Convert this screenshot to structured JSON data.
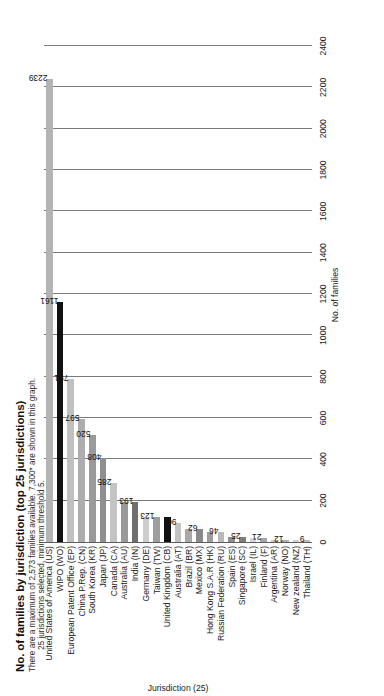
{
  "chart_data": {
    "type": "bar",
    "orientation": "horizontal",
    "title": "No. of families by jurisdiction (top 25 jurisdictions)",
    "subtitle_line1": "There are a maximum of 2,573 families available. 7,300* are shown in this graph.",
    "subtitle_line2": "25 jurisdictions selected, minimum threshold 5.",
    "xlabel": "No. of families",
    "ylabel": "Jurisdiction (25)",
    "xlim": [
      0,
      2400
    ],
    "xticks": [
      0,
      200,
      400,
      600,
      800,
      1000,
      1200,
      1400,
      1600,
      1800,
      2000,
      2200,
      2400
    ],
    "grid": "vertical",
    "legend": "none",
    "categories": [
      "United States of America (US)",
      "WIPO (WO)",
      "European Patent Office (EP)",
      "China P.Rep. (CN)",
      "South Korea (KR)",
      "Japan (JP)",
      "Canada (CA)",
      "Australia (AU)",
      "India (IN)",
      "Germany (DE)",
      "Taiwan (TW)",
      "United Kingdom (CB)",
      "Australia (AT)",
      "Brazil (BR)",
      "Mexico (MX)",
      "Hong Kong S.A.R (HK)",
      "Russian Federation (RU)",
      "Spain (ES)",
      "Singapore (SC)",
      "Israel (IL)",
      "Finland (F)",
      "Argentina (AR)",
      "Norway (NO)",
      "New zealand (NZ)",
      "Thailand (TH)"
    ],
    "values": [
      2239,
      1161,
      791,
      597,
      520,
      408,
      285,
      193,
      193,
      123,
      123,
      123,
      90,
      62,
      62,
      46,
      46,
      25,
      25,
      21,
      21,
      12,
      12,
      9,
      9
    ],
    "value_labels": [
      "2239",
      "1161",
      "791",
      "597",
      "520",
      "408",
      "285",
      "",
      "193",
      "",
      "123",
      "",
      "90",
      "",
      "62",
      "",
      "46",
      "",
      "25",
      "",
      "21",
      "",
      "12",
      "",
      "9"
    ],
    "bar_colors": [
      "#b4b4b4",
      "#111111",
      "#c0c0c0",
      "#adadad",
      "#9a9a9a",
      "#8f8f8f",
      "#c4c4c4",
      "#999999",
      "#6f6f6f",
      "#cdcdcd",
      "#9e9e9e",
      "#111111",
      "#c2c2c2",
      "#a8a8a8",
      "#8a8a8a",
      "#9d9d9d",
      "#b9b9b9",
      "#8e8e8e",
      "#7d7d7d",
      "#d4d4d4",
      "#a5a5a5",
      "#c8c8c8",
      "#b0b0b0",
      "#cfcfcf",
      "#bdbdbd"
    ]
  }
}
